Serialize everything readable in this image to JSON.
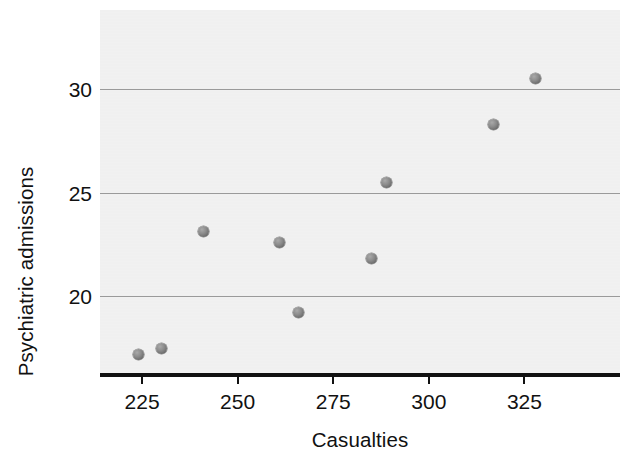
{
  "chart_data": {
    "type": "scatter",
    "title": "",
    "xlabel": "Casualties",
    "ylabel": "Psychiatric admissions",
    "xlim": [
      214,
      350
    ],
    "ylim": [
      16.3,
      33.8
    ],
    "xticks": [
      225,
      250,
      275,
      300,
      325
    ],
    "yticks": [
      20,
      25,
      30
    ],
    "xtick_labels": [
      "225",
      "250",
      "275",
      "300",
      "325"
    ],
    "ytick_labels": [
      "20",
      "25",
      "30"
    ],
    "grid": "horizontal",
    "legend": "none",
    "marker": "filled-circle",
    "marker_color": "#7a7a7a",
    "panel_color": "#eeeeee",
    "gridline_color": "#9a9a9a",
    "axis_color": "#111111",
    "points": [
      {
        "x": 224,
        "y": 17.2
      },
      {
        "x": 230,
        "y": 17.5
      },
      {
        "x": 241,
        "y": 23.1
      },
      {
        "x": 261,
        "y": 22.6
      },
      {
        "x": 266,
        "y": 19.2
      },
      {
        "x": 285,
        "y": 21.8
      },
      {
        "x": 289,
        "y": 25.5
      },
      {
        "x": 317,
        "y": 28.3
      },
      {
        "x": 328,
        "y": 30.5
      }
    ]
  }
}
